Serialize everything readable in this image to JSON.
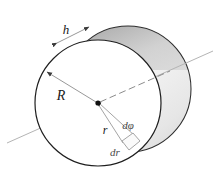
{
  "figure": {
    "labels": {
      "height": "h",
      "outer_radius": "R",
      "element_radius": "r",
      "angle_element": "dφ",
      "radial_element": "dr"
    },
    "colors": {
      "outline": "#1a1a1a",
      "face": "#ffffff",
      "side_light": "#f2f2f2",
      "side_mid": "#d2d2d2",
      "side_dark": "#9a9a9a",
      "axis": "#b4b4b4",
      "leader": "#8c8c8c",
      "label_text": "#1a1a1a",
      "element_line": "#9a9a9a"
    },
    "geometry": {
      "front_circle": {
        "cx": 98,
        "cy": 103,
        "r": 63
      },
      "back_circle": {
        "cx": 128,
        "cy": 89,
        "r": 63
      },
      "center_dot": {
        "x": 98,
        "y": 103,
        "r": 2.6
      },
      "axis_line": {
        "x1": 7,
        "y1": 143,
        "x2": 213,
        "y2": 51
      },
      "dashed_segment": {
        "x1": 98,
        "y1": 103,
        "x2": 168,
        "y2": 72
      },
      "radius_arrow": {
        "x1": 98,
        "y1": 103,
        "x2": 45,
        "y2": 71
      },
      "h_arrow": {
        "x1": 57,
        "y1": 43,
        "x2": 89,
        "y2": 27
      },
      "element": {
        "inner_near": {
          "x": 122,
          "y": 141
        },
        "inner_far": {
          "x": 132,
          "y": 134
        },
        "outer_near": {
          "x": 129,
          "y": 149
        },
        "outer_far": {
          "x": 138,
          "y": 141
        }
      }
    },
    "label_positions": {
      "h": {
        "x": 66,
        "y": 34
      },
      "R": {
        "x": 61,
        "y": 100
      },
      "r": {
        "x": 105,
        "y": 133
      },
      "dphi": {
        "x": 128,
        "y": 128
      },
      "dr": {
        "x": 114,
        "y": 155
      }
    }
  }
}
